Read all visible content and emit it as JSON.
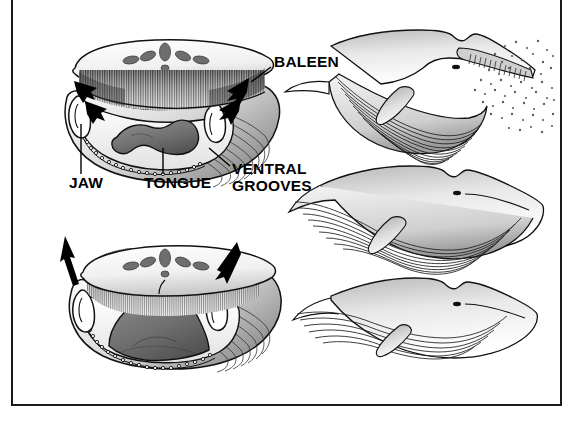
{
  "figure": {
    "background_color": "#ffffff",
    "ink_color": "#000000",
    "frame": {
      "border_color": "#1a1a1a",
      "border_width_px": 2
    }
  },
  "labels": {
    "baleen": "BALEEN",
    "jaw": "JAW",
    "tongue": "TONGUE",
    "ventral_grooves_line1": "VENTRAL",
    "ventral_grooves_line2": "GROOVES"
  },
  "panels": {
    "cross_section_open": {
      "name": "mouth-open-cross-section",
      "description": "Frontal cross-section of an open whale mouth showing baleen plates hanging from the upper jaw, the tongue lying in the floor of the mouth, and the distended ventral grooves.",
      "arrows": [
        {
          "name": "inflow-arrow-left-upper",
          "direction": "right-down"
        },
        {
          "name": "inflow-arrow-left-lower",
          "direction": "right-down"
        },
        {
          "name": "inflow-arrow-right-upper",
          "direction": "left-down"
        },
        {
          "name": "inflow-arrow-right-lower",
          "direction": "left-down"
        }
      ]
    },
    "cross_section_closing": {
      "name": "mouth-closing-cross-section",
      "description": "Frontal cross-section of the mouth closing: the tongue rises, the ventral pouch contracts and water is forced out through the baleen.",
      "arrows": [
        {
          "name": "outflow-arrow-left",
          "direction": "up"
        },
        {
          "name": "outflow-arrow-right",
          "direction": "left-down"
        }
      ]
    },
    "whale_stage_1": {
      "name": "whale-lunge-gulping",
      "description": "Side view of a rorqual whale with the mouth fully open, throat pouch ballooned, engulfing a swarm of krill."
    },
    "whale_stage_2": {
      "name": "whale-pouch-full",
      "description": "Side view with the mouth shut and the ventral pouch still hugely distended with water."
    },
    "whale_stage_3": {
      "name": "whale-pouch-emptied",
      "description": "Side view with the pouch deflated after water has been expelled through the baleen."
    },
    "prey": {
      "name": "krill-swarm",
      "description": "Stippled cloud of krill drifting into the open mouth."
    }
  }
}
